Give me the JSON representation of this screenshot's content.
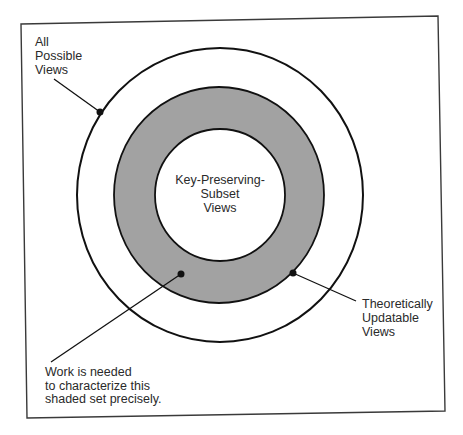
{
  "diagram": {
    "type": "nested-set-diagram",
    "colors": {
      "frame": "#3a3a3a",
      "stroke": "#111111",
      "shaded_ring": "#a2a2a2",
      "background": "#ffffff"
    },
    "sets": [
      {
        "name": "All Possible Views",
        "label_lines": [
          "All",
          "Possible",
          "Views"
        ]
      },
      {
        "name": "Theoretically Updatable Views",
        "label_lines": [
          "Theoretically",
          "Updatable",
          "Views"
        ],
        "shaded": true
      },
      {
        "name": "Key-Preserving-Subset Views",
        "label_lines": [
          "Key-Preserving-",
          "Subset",
          "Views"
        ]
      }
    ],
    "annotation": {
      "label_lines": [
        "Work is needed",
        "to characterize this",
        "shaded set precisely."
      ],
      "points_to": "shaded ring"
    }
  }
}
